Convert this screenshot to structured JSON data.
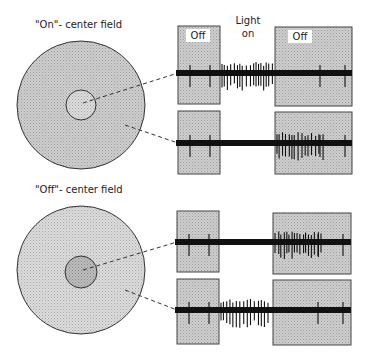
{
  "labels": {
    "on_center": "\"On\"- center field",
    "off_center": "\"Off\"- center field",
    "light_line1": "Light",
    "light_line2": "on",
    "off_left": "Off",
    "off_right": "Off"
  },
  "colors": {
    "background": "#ffffff",
    "field_gray": "#c4c4c4",
    "field_light": "#d8d8d8",
    "field_dark": "#b0b0b0",
    "box_fill": "#c8c8c8",
    "stroke": "#333333",
    "trace": "#111111"
  },
  "fields": [
    {
      "name": "on-center",
      "cx": 81,
      "cy": 105,
      "outer_r": 64,
      "inner_r": 15,
      "inner_shade": "light",
      "outer_shade": "gray"
    },
    {
      "name": "off-center",
      "cx": 81,
      "cy": 270,
      "outer_r": 64,
      "inner_r": 16,
      "inner_shade": "dark",
      "outer_shade": "light"
    }
  ],
  "recordings": [
    {
      "row": 1,
      "stimulus": "center",
      "baseline_y": 73,
      "left_box": [
        178,
        26,
        42,
        78
      ],
      "right_box": [
        275,
        27,
        77,
        79
      ],
      "burst": "light-on",
      "show_off_labels": true
    },
    {
      "row": 2,
      "stimulus": "surround",
      "baseline_y": 143,
      "left_box": [
        178,
        111,
        42,
        63
      ],
      "right_box": [
        275,
        112,
        77,
        62
      ],
      "burst": "light-off",
      "show_off_labels": false
    },
    {
      "row": 3,
      "stimulus": "center",
      "baseline_y": 242,
      "left_box": [
        177,
        211,
        42,
        61
      ],
      "right_box": [
        273,
        213,
        78,
        61
      ],
      "burst": "light-off",
      "show_off_labels": false
    },
    {
      "row": 4,
      "stimulus": "surround",
      "baseline_y": 310,
      "left_box": [
        177,
        279,
        42,
        65
      ],
      "right_box": [
        273,
        280,
        78,
        65
      ],
      "burst": "light-on",
      "show_off_labels": false
    }
  ]
}
